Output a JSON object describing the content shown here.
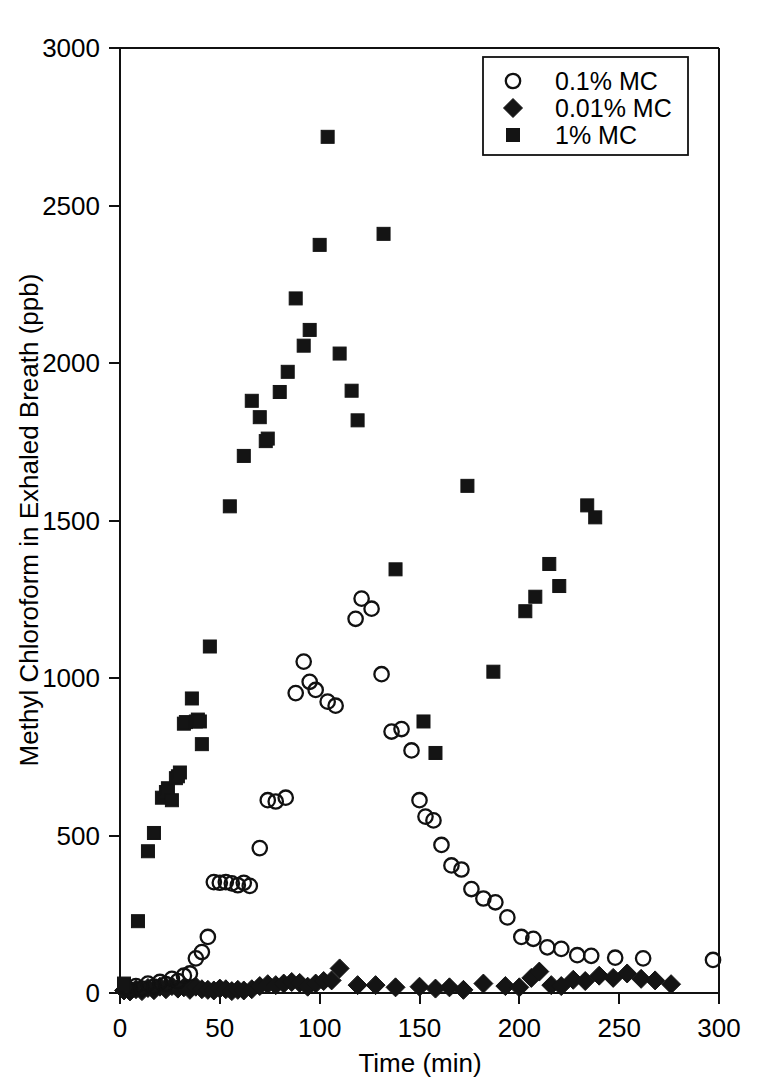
{
  "chart_data": {
    "type": "scatter",
    "title": "",
    "xlabel": "Time (min)",
    "ylabel": "Methyl Chloroform in Exhaled Breath (ppb)",
    "xlim": [
      0,
      300
    ],
    "ylim": [
      0,
      3000
    ],
    "xticks": [
      0,
      50,
      100,
      150,
      200,
      250,
      300
    ],
    "yticks": [
      0,
      500,
      1000,
      1500,
      2000,
      2500,
      3000
    ],
    "xtick_labels": [
      "0",
      "50",
      "100",
      "150",
      "200",
      "250",
      "300"
    ],
    "ytick_labels": [
      "0",
      "500",
      "1000",
      "1500",
      "2000",
      "2500",
      "3000"
    ],
    "grid": false,
    "legend_position": "top-right",
    "series": [
      {
        "name": "0.1% MC",
        "marker": "open-circle",
        "color": "#111111",
        "points": [
          [
            3,
            18
          ],
          [
            5,
            10
          ],
          [
            8,
            22
          ],
          [
            11,
            14
          ],
          [
            14,
            30
          ],
          [
            17,
            20
          ],
          [
            20,
            35
          ],
          [
            23,
            28
          ],
          [
            26,
            45
          ],
          [
            29,
            38
          ],
          [
            32,
            55
          ],
          [
            35,
            62
          ],
          [
            38,
            110
          ],
          [
            41,
            130
          ],
          [
            44,
            178
          ],
          [
            47,
            352
          ],
          [
            50,
            350
          ],
          [
            53,
            352
          ],
          [
            56,
            348
          ],
          [
            59,
            342
          ],
          [
            62,
            350
          ],
          [
            65,
            340
          ],
          [
            70,
            460
          ],
          [
            74,
            612
          ],
          [
            78,
            608
          ],
          [
            83,
            620
          ],
          [
            88,
            952
          ],
          [
            92,
            1052
          ],
          [
            95,
            988
          ],
          [
            98,
            962
          ],
          [
            104,
            925
          ],
          [
            108,
            912
          ],
          [
            118,
            1188
          ],
          [
            121,
            1252
          ],
          [
            126,
            1220
          ],
          [
            131,
            1012
          ],
          [
            136,
            830
          ],
          [
            141,
            838
          ],
          [
            146,
            770
          ],
          [
            150,
            612
          ],
          [
            153,
            560
          ],
          [
            157,
            548
          ],
          [
            161,
            470
          ],
          [
            166,
            405
          ],
          [
            171,
            392
          ],
          [
            176,
            330
          ],
          [
            182,
            300
          ],
          [
            188,
            288
          ],
          [
            194,
            240
          ],
          [
            201,
            178
          ],
          [
            207,
            172
          ],
          [
            214,
            145
          ],
          [
            221,
            140
          ],
          [
            229,
            120
          ],
          [
            236,
            118
          ],
          [
            248,
            112
          ],
          [
            262,
            110
          ],
          [
            297,
            105
          ]
        ]
      },
      {
        "name": "0.01% MC",
        "marker": "filled-diamond",
        "color": "#141414",
        "points": [
          [
            2,
            8
          ],
          [
            5,
            5
          ],
          [
            8,
            12
          ],
          [
            11,
            6
          ],
          [
            14,
            16
          ],
          [
            17,
            9
          ],
          [
            20,
            20
          ],
          [
            23,
            12
          ],
          [
            26,
            22
          ],
          [
            29,
            14
          ],
          [
            32,
            18
          ],
          [
            35,
            10
          ],
          [
            38,
            20
          ],
          [
            41,
            12
          ],
          [
            44,
            10
          ],
          [
            47,
            8
          ],
          [
            50,
            14
          ],
          [
            53,
            12
          ],
          [
            56,
            6
          ],
          [
            59,
            10
          ],
          [
            62,
            8
          ],
          [
            66,
            12
          ],
          [
            70,
            22
          ],
          [
            74,
            28
          ],
          [
            78,
            25
          ],
          [
            82,
            30
          ],
          [
            86,
            35
          ],
          [
            90,
            32
          ],
          [
            94,
            20
          ],
          [
            98,
            30
          ],
          [
            102,
            38
          ],
          [
            106,
            40
          ],
          [
            110,
            78
          ],
          [
            119,
            25
          ],
          [
            128,
            25
          ],
          [
            138,
            18
          ],
          [
            150,
            20
          ],
          [
            158,
            14
          ],
          [
            165,
            18
          ],
          [
            172,
            10
          ],
          [
            182,
            30
          ],
          [
            193,
            22
          ],
          [
            200,
            18
          ],
          [
            206,
            48
          ],
          [
            210,
            68
          ],
          [
            216,
            25
          ],
          [
            221,
            22
          ],
          [
            227,
            42
          ],
          [
            233,
            38
          ],
          [
            240,
            55
          ],
          [
            247,
            48
          ],
          [
            254,
            62
          ],
          [
            261,
            45
          ],
          [
            268,
            40
          ],
          [
            276,
            28
          ]
        ]
      },
      {
        "name": "1% MC",
        "marker": "filled-square",
        "color": "#141414",
        "points": [
          [
            2,
            30
          ],
          [
            9,
            228
          ],
          [
            14,
            450
          ],
          [
            17,
            508
          ],
          [
            21,
            620
          ],
          [
            23,
            638
          ],
          [
            24,
            650
          ],
          [
            26,
            612
          ],
          [
            28,
            682
          ],
          [
            29,
            688
          ],
          [
            30,
            700
          ],
          [
            32,
            855
          ],
          [
            33,
            860
          ],
          [
            36,
            935
          ],
          [
            38,
            862
          ],
          [
            39,
            868
          ],
          [
            40,
            862
          ],
          [
            41,
            790
          ],
          [
            45,
            1100
          ],
          [
            55,
            1545
          ],
          [
            62,
            1705
          ],
          [
            66,
            1880
          ],
          [
            70,
            1828
          ],
          [
            73,
            1752
          ],
          [
            74,
            1760
          ],
          [
            80,
            1908
          ],
          [
            84,
            1972
          ],
          [
            88,
            2205
          ],
          [
            92,
            2055
          ],
          [
            95,
            2105
          ],
          [
            100,
            2375
          ],
          [
            104,
            2718
          ],
          [
            110,
            2030
          ],
          [
            116,
            1912
          ],
          [
            119,
            1818
          ],
          [
            132,
            2410
          ],
          [
            138,
            1345
          ],
          [
            152,
            862
          ],
          [
            158,
            762
          ],
          [
            174,
            1610
          ],
          [
            187,
            1020
          ],
          [
            203,
            1212
          ],
          [
            208,
            1258
          ],
          [
            215,
            1362
          ],
          [
            220,
            1292
          ],
          [
            234,
            1548
          ],
          [
            238,
            1510
          ]
        ]
      }
    ]
  },
  "legend": {
    "entries": [
      {
        "label": "0.1% MC",
        "marker": "open-circle"
      },
      {
        "label": "0.01% MC",
        "marker": "filled-diamond"
      },
      {
        "label": "1% MC",
        "marker": "filled-square"
      }
    ]
  },
  "axes": {
    "x_title": "Time (min)",
    "y_title": "Methyl Chloroform in Exhaled Breath (ppb)"
  }
}
